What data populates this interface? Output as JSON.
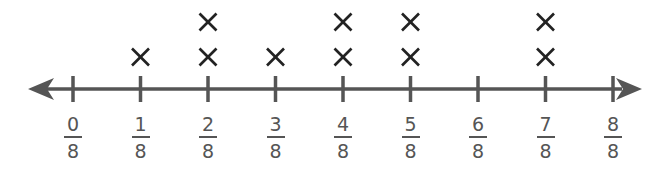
{
  "chart_data": {
    "type": "line-plot",
    "title": "",
    "xlabel": "",
    "ylabel": "",
    "categories": [
      "0/8",
      "1/8",
      "2/8",
      "3/8",
      "4/8",
      "5/8",
      "6/8",
      "7/8",
      "8/8"
    ],
    "x": [
      0,
      0.125,
      0.25,
      0.375,
      0.5,
      0.625,
      0.75,
      0.875,
      1
    ],
    "values": [
      0,
      1,
      2,
      1,
      2,
      2,
      0,
      2,
      0
    ],
    "marker": "X",
    "axis": {
      "range": [
        0,
        1
      ],
      "arrows": "both",
      "tick_count": 9
    },
    "ticks": [
      {
        "num": "0",
        "den": "8"
      },
      {
        "num": "1",
        "den": "8"
      },
      {
        "num": "2",
        "den": "8"
      },
      {
        "num": "3",
        "den": "8"
      },
      {
        "num": "4",
        "den": "8"
      },
      {
        "num": "5",
        "den": "8"
      },
      {
        "num": "6",
        "den": "8"
      },
      {
        "num": "7",
        "den": "8"
      },
      {
        "num": "8",
        "den": "8"
      }
    ]
  },
  "colors": {
    "axis": "#555555",
    "marker": "#222222",
    "label": "#555555"
  }
}
